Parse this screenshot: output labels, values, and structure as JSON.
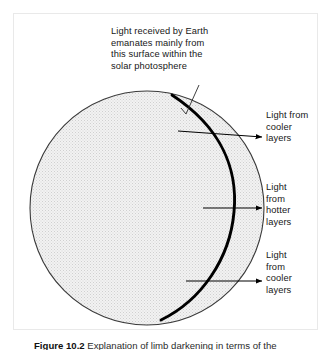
{
  "figure": {
    "title_annotation": "Light received by Earth\nemanates mainly from\nthis surface within the\nsolar photosphere",
    "caption_label": "Figure 10.2",
    "caption_text": "Explanation of limb darkening in terms of the",
    "labels": {
      "cooler_upper": "Light from\ncooler\nlayers",
      "hotter": "Light\nfrom\nhotter\nlayers",
      "cooler_lower": "Light\nfrom\ncooler\nlayers"
    }
  },
  "colors": {
    "background": "#ffffff",
    "frame_border": "#e9e9e9",
    "sun_fill": "#ebebeb",
    "sun_stipple": "#d2d2d2",
    "sun_outline": "#3a3a3a",
    "photosphere_arc": "#000000",
    "arrow": "#000000",
    "leader_line": "#2a2a2a",
    "text": "#171717"
  },
  "geometry": {
    "sun_center_x": 147,
    "sun_center_y": 208,
    "sun_radius": 117,
    "arc_label": "photosphere-surface-arc",
    "arrows": [
      {
        "name": "arrow-cooler-upper",
        "x1": 178,
        "y1": 131,
        "x2": 262,
        "y2": 137
      },
      {
        "name": "arrow-hotter",
        "x1": 205,
        "y1": 208,
        "x2": 262,
        "y2": 208
      },
      {
        "name": "arrow-cooler-lower",
        "x1": 186,
        "y1": 281,
        "x2": 262,
        "y2": 281
      }
    ],
    "leader_line": {
      "name": "leader-line-photosphere",
      "x1": 196,
      "y1": 86,
      "x2": 185,
      "y2": 116
    }
  }
}
